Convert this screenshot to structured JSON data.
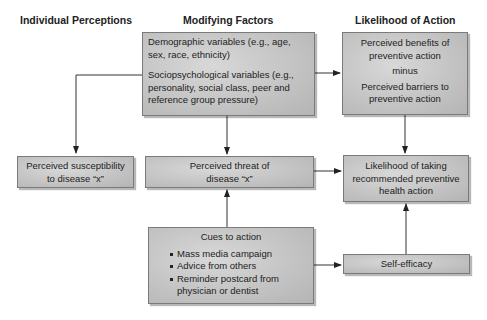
{
  "headers": {
    "individual": "Individual Perceptions",
    "modifying": "Modifying Factors",
    "likelihood": "Likelihood of Action"
  },
  "boxes": {
    "modifying_factors": {
      "demographic": "Demographic variables (e.g., age, sex, race, ethnicity)",
      "sociopsychological": "Sociopsychological variables (e.g., personality, social class, peer and reference group pressure)"
    },
    "benefits_barriers": {
      "benefits": "Perceived benefits of preventive action",
      "operator": "minus",
      "barriers": "Perceived barriers to preventive action"
    },
    "susceptibility": "Perceived susceptibility to disease “x”",
    "threat": "Perceived threat of disease “x”",
    "likelihood_action": "Likelihood of taking recommended preventive health action",
    "cues": {
      "title": "Cues to action",
      "items": [
        "Mass media campaign",
        "Advice from others",
        "Reminder postcard from physician or dentist"
      ]
    },
    "self_efficacy": "Self-efficacy"
  },
  "colors": {
    "box_fill": "#c4c4c4",
    "box_border": "#7a7a7a",
    "line": "#333333",
    "text": "#222222"
  }
}
